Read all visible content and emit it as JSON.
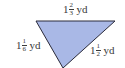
{
  "diagram": {
    "shape": "triangle",
    "fill_color": "#a9b8e6",
    "stroke_color": "#2a2a3a",
    "vertices": [
      [
        36,
        21
      ],
      [
        115,
        21
      ],
      [
        63,
        68
      ]
    ],
    "sides": {
      "top": {
        "whole": "1",
        "numerator": "2",
        "denominator": "3",
        "unit": "yd"
      },
      "left": {
        "whole": "1",
        "numerator": "1",
        "denominator": "6",
        "unit": "yd"
      },
      "right": {
        "whole": "1",
        "numerator": "1",
        "denominator": "2",
        "unit": "yd"
      }
    }
  }
}
